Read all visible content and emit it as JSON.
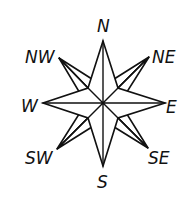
{
  "diagram": {
    "type": "compass-rose",
    "style": "hand-drawn line art",
    "colors": {
      "ink": "#111111",
      "background": "#ffffff"
    },
    "center": [
      103,
      103
    ],
    "labels": {
      "north": "N",
      "northeast": "NE",
      "east": "E",
      "southeast": "SE",
      "south": "S",
      "southwest": "SW",
      "west": "W",
      "northwest": "NW"
    }
  }
}
